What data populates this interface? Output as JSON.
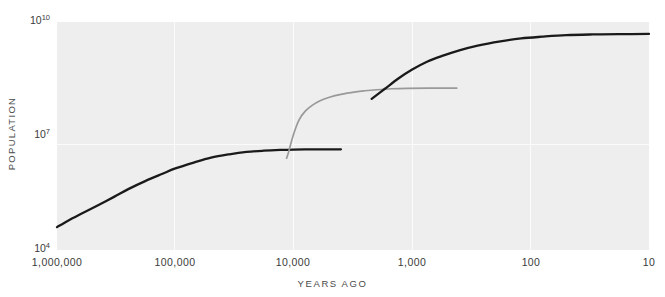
{
  "chart_data": {
    "type": "line",
    "title": "",
    "xlabel": "YEARS AGO",
    "ylabel": "POPULATION",
    "xscale": "log-reversed",
    "yscale": "log",
    "xlim": [
      1000000,
      10
    ],
    "ylim": [
      10000,
      10000000000
    ],
    "grid": true,
    "legend": "none",
    "xticks": [
      "1,000,000",
      "100,000",
      "10,000",
      "1,000",
      "100",
      "10"
    ],
    "xtick_values": [
      1000000,
      100000,
      10000,
      1000,
      100,
      10
    ],
    "yticks": [
      "10",
      "10",
      "10"
    ],
    "ytick_exponents": [
      "10",
      "7",
      "4"
    ],
    "ytick_values": [
      10000000000,
      10000000,
      10000
    ],
    "series": [
      {
        "name": "hunter-gatherer-plateau",
        "color": "#1a1a1a",
        "points": [
          [
            1000000,
            40000
          ],
          [
            800000,
            60000
          ],
          [
            600000,
            95000
          ],
          [
            450000,
            150000
          ],
          [
            330000,
            250000
          ],
          [
            250000,
            400000
          ],
          [
            180000,
            650000
          ],
          [
            130000,
            1000000
          ],
          [
            100000,
            1400000
          ],
          [
            70000,
            2000000
          ],
          [
            50000,
            2700000
          ],
          [
            35000,
            3300000
          ],
          [
            25000,
            3800000
          ],
          [
            18000,
            4100000
          ],
          [
            13000,
            4300000
          ],
          [
            10000,
            4400000
          ],
          [
            7000,
            4450000
          ],
          [
            5000,
            4450000
          ],
          [
            4000,
            4450000
          ]
        ]
      },
      {
        "name": "agricultural-revolution-rise",
        "color": "#999999",
        "points": [
          [
            11500,
            2600000
          ],
          [
            11000,
            4000000
          ],
          [
            10500,
            7000000
          ],
          [
            9800,
            14000000
          ],
          [
            9000,
            27000000
          ],
          [
            8000,
            45000000
          ],
          [
            7000,
            64000000
          ],
          [
            6000,
            85000000
          ],
          [
            5000,
            105000000
          ],
          [
            4000,
            125000000
          ],
          [
            3000,
            145000000
          ],
          [
            2500,
            155000000
          ],
          [
            2000,
            165000000
          ],
          [
            1500,
            175000000
          ],
          [
            1100,
            180000000
          ],
          [
            700,
            182000000
          ],
          [
            420,
            182000000
          ]
        ]
      },
      {
        "name": "industrial-revolution-rise",
        "color": "#1a1a1a",
        "points": [
          [
            2200,
            95000000
          ],
          [
            1700,
            175000000
          ],
          [
            1300,
            330000000
          ],
          [
            1000,
            560000000
          ],
          [
            750,
            900000000
          ],
          [
            550,
            1300000000
          ],
          [
            400,
            1800000000
          ],
          [
            280,
            2400000000
          ],
          [
            180,
            3100000000
          ],
          [
            120,
            3700000000
          ],
          [
            80,
            4100000000
          ],
          [
            50,
            4500000000
          ],
          [
            30,
            4700000000
          ],
          [
            18,
            4800000000
          ],
          [
            10,
            4850000000
          ]
        ]
      }
    ]
  }
}
